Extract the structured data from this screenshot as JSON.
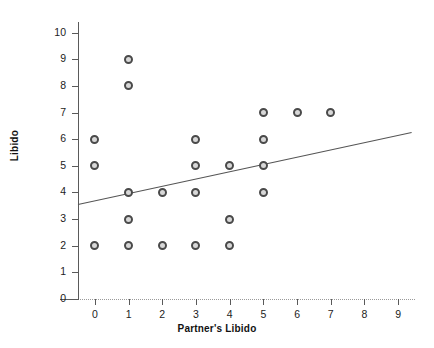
{
  "chart_data": {
    "type": "scatter",
    "title": "",
    "xlabel": "Partner's Libido",
    "ylabel": "Libido",
    "xlim": [
      -0.5,
      9.5
    ],
    "ylim": [
      0,
      10.4
    ],
    "xticks": [
      0,
      1,
      2,
      3,
      4,
      5,
      6,
      7,
      8,
      9
    ],
    "yticks": [
      0,
      1,
      2,
      3,
      4,
      5,
      6,
      7,
      8,
      9,
      10
    ],
    "grid": false,
    "legend": "none",
    "points": [
      {
        "x": 0,
        "y": 6
      },
      {
        "x": 0,
        "y": 5
      },
      {
        "x": 0,
        "y": 2
      },
      {
        "x": 1,
        "y": 9
      },
      {
        "x": 1,
        "y": 8
      },
      {
        "x": 1,
        "y": 4
      },
      {
        "x": 1,
        "y": 3
      },
      {
        "x": 1,
        "y": 2
      },
      {
        "x": 2,
        "y": 4
      },
      {
        "x": 2,
        "y": 2
      },
      {
        "x": 3,
        "y": 6
      },
      {
        "x": 3,
        "y": 5
      },
      {
        "x": 3,
        "y": 4
      },
      {
        "x": 3,
        "y": 2
      },
      {
        "x": 4,
        "y": 5
      },
      {
        "x": 4,
        "y": 3
      },
      {
        "x": 4,
        "y": 2
      },
      {
        "x": 5,
        "y": 7
      },
      {
        "x": 5,
        "y": 6
      },
      {
        "x": 5,
        "y": 5
      },
      {
        "x": 5,
        "y": 4
      },
      {
        "x": 6,
        "y": 7
      },
      {
        "x": 7,
        "y": 7
      }
    ],
    "fit_line": {
      "kind": "linear-regression",
      "x_start": -0.5,
      "y_start": 3.55,
      "x_end": 9.4,
      "y_end": 6.25,
      "color": "#555555"
    },
    "marker": {
      "shape": "circle",
      "edge_color": "#4a4a4a",
      "fill_color": "#d8d8d8",
      "size_px": 9
    },
    "axis_color": "#5a5a5a",
    "text_color": "#1c1c1c",
    "background": "#ffffff"
  }
}
